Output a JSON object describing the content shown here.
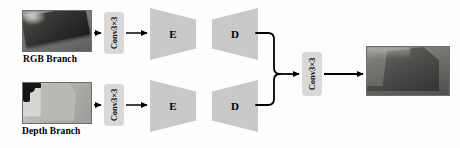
{
  "figure": {
    "type": "neural-network-architecture-diagram"
  },
  "branches": [
    {
      "id": "rgb",
      "caption": "RGB Branch",
      "input_thumbnail": "rgb-input-image",
      "conv_label": "Conv3×3",
      "encoder_label": "E",
      "decoder_label": "D"
    },
    {
      "id": "depth",
      "caption": "Depth Branch",
      "input_thumbnail": "depth-input-image",
      "conv_label": "Conv3×3",
      "encoder_label": "E",
      "decoder_label": "D"
    }
  ],
  "fusion": {
    "conv_label": "Conv3×3",
    "output_thumbnail": "output-image"
  },
  "ghost_text": {
    "line1": "",
    "line2": "",
    "line3": ""
  },
  "colors": {
    "trapezoid_fill": "#c9c9c9",
    "conv_fill": "#d9d9d9",
    "arrow": "#000000",
    "thumbnail_border": "#6e6e6e",
    "caption_text": "#000000",
    "background": "#fdfdfd"
  }
}
